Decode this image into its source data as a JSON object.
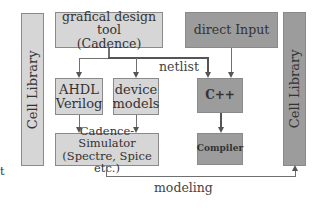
{
  "diagram": {
    "left_library": {
      "label": "Cell Library"
    },
    "right_library": {
      "label": "Cell Library"
    },
    "design_tool": {
      "line1": "grafical design tool",
      "line2": "(Cadence)"
    },
    "direct_input": {
      "label": "direct Input"
    },
    "ahdl": {
      "line1": "AHDL",
      "line2": "Verilog"
    },
    "device_models": {
      "line1": "device",
      "line2": "models"
    },
    "simulator": {
      "line1": "Cadence-Simulator",
      "line2": "(Spectre, Spice etc.)"
    },
    "cpp": {
      "label": "C++"
    },
    "compiler": {
      "label": "Compiler"
    },
    "edges": {
      "netlist": "netlist",
      "modeling": "modeling"
    },
    "stray_mark": "t"
  },
  "colors": {
    "light_box": "#d6d6d6",
    "dark_box": "#9c9c9c",
    "line": "#707070"
  }
}
